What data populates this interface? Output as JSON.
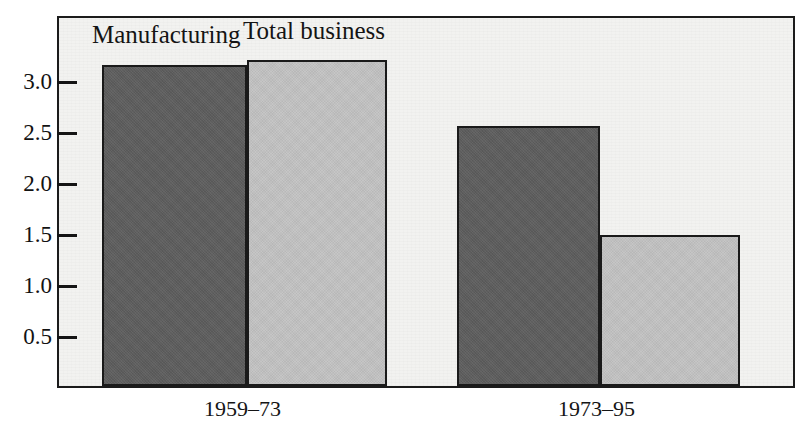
{
  "figure": {
    "top_cut_text": "",
    "panel_bg": "#f2f2f0",
    "frame_color": "#1b1b1b"
  },
  "chart_data": {
    "type": "bar",
    "title": "",
    "subtitle": "",
    "xlabel": "",
    "ylabel": "",
    "categories": [
      "1959–73",
      "1973–95"
    ],
    "series": [
      {
        "name": "Manufacturing",
        "color": "#5d5d5d",
        "values": [
          3.15,
          2.55
        ]
      },
      {
        "name": "Total business",
        "color": "#bfbfbf",
        "values": [
          3.2,
          1.48
        ]
      }
    ],
    "ylim": [
      0,
      3.65
    ],
    "yticks": [
      0.5,
      1.0,
      1.5,
      2.0,
      2.5,
      3.0
    ],
    "ytick_labels": [
      "0.5",
      "1.0",
      "1.5",
      "2.0",
      "2.5",
      "3.0"
    ],
    "grid": false,
    "legend": "in-plot labels above first group",
    "annotations": [
      {
        "text": "Manufacturing",
        "series": 0
      },
      {
        "text": "Total business",
        "series": 1
      }
    ]
  }
}
